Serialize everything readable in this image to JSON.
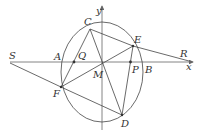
{
  "diagram": {
    "type": "geometry",
    "axes": {
      "x_label": "x",
      "y_label": "y"
    },
    "points": {
      "A": {
        "label": "A"
      },
      "B": {
        "label": "B"
      },
      "C": {
        "label": "C"
      },
      "D": {
        "label": "D"
      },
      "E": {
        "label": "E"
      },
      "F": {
        "label": "F"
      },
      "M": {
        "label": "M"
      },
      "P": {
        "label": "P"
      },
      "Q": {
        "label": "Q"
      },
      "R": {
        "label": "R"
      },
      "S": {
        "label": "S"
      }
    },
    "segments": [
      "SF",
      "FD",
      "FE",
      "CF",
      "CD",
      "CER",
      "EPD"
    ],
    "colors": {
      "line": "#444444",
      "axis": "#666666",
      "label": "#333333"
    }
  }
}
